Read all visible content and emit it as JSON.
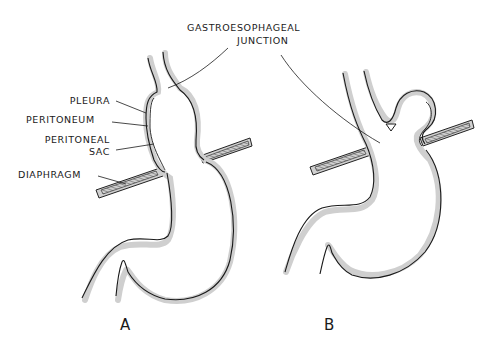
{
  "figure": {
    "type": "anatomical-diagram",
    "colors": {
      "outline": "#1a1a1a",
      "membrane_shade": "#c8c8c8",
      "diaphragm_hatch": "#555555",
      "background": "#ffffff"
    }
  },
  "labels": {
    "gastroesophageal_junction_line1": "GASTROESOPHAGEAL",
    "gastroesophageal_junction_line2": "JUNCTION",
    "pleura": "PLEURA",
    "peritoneum": "PERITONEUM",
    "peritoneal_sac_line1": "PERITONEAL",
    "peritoneal_sac_line2": "SAC",
    "diaphragm": "DIAPHRAGM"
  },
  "panels": [
    {
      "id": "A",
      "label": "A",
      "description": "Normal anatomy: gastroesophageal junction below the diaphragm"
    },
    {
      "id": "B",
      "label": "B",
      "description": "Paraesophageal hernia: fundus herniated above the diaphragm alongside the esophagus"
    }
  ]
}
